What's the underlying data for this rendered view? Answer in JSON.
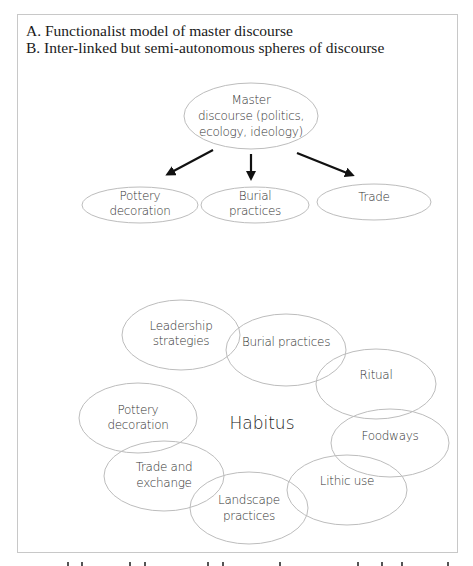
{
  "figure": {
    "heading_a": "A. Functionalist model of master discourse",
    "heading_b": "B. Inter-linked but semi-autonomous spheres of discourse",
    "model_a": {
      "master_node": {
        "line1": "Master",
        "line2": "discourse (politics,",
        "line3": "ecology, ideology)"
      },
      "child_nodes": [
        {
          "line1": "Pottery",
          "line2": "decoration"
        },
        {
          "line1": "Burial",
          "line2": "practices"
        },
        {
          "line1": "Trade",
          "line2": ""
        }
      ]
    },
    "model_b": {
      "center_label": "Habitus",
      "spheres": [
        {
          "line1": "Leadership",
          "line2": "strategies"
        },
        {
          "line1": "Burial practices",
          "line2": ""
        },
        {
          "line1": "Ritual",
          "line2": ""
        },
        {
          "line1": "Foodways",
          "line2": ""
        },
        {
          "line1": "Lithic use",
          "line2": ""
        },
        {
          "line1": "Landscape",
          "line2": "practices"
        },
        {
          "line1": "Trade and",
          "line2": "exchange"
        },
        {
          "line1": "Pottery",
          "line2": "decoration"
        }
      ]
    }
  },
  "colors": {
    "ellipse_stroke": "#bdbdbd",
    "arrow": "#111111",
    "frame_border": "#c8c8c8",
    "text": "#333333"
  }
}
